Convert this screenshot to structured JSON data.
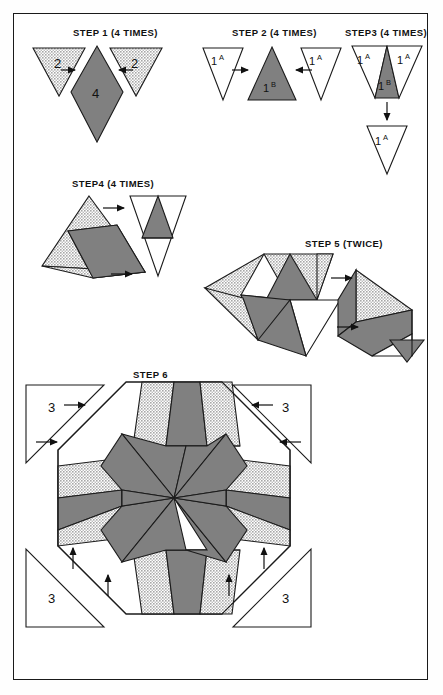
{
  "page": {
    "frame_color": "#1a1a1a",
    "background": "#ffffff"
  },
  "colors": {
    "dark_gray": "#808080",
    "light_gray_stipple": "#c9c9c9",
    "white": "#ffffff",
    "outline": "#1b1b1b",
    "text": "#111111"
  },
  "steps": [
    {
      "id": "step1",
      "label": "STEP 1 (4 TIMES)",
      "pieces": [
        {
          "name": "left-triangle-2",
          "value": "2",
          "fill": "light"
        },
        {
          "name": "center-diamond-4",
          "value": "4",
          "fill": "dark"
        },
        {
          "name": "right-triangle-2",
          "value": "2",
          "fill": "light"
        }
      ],
      "arrows": 2
    },
    {
      "id": "step2",
      "label": "STEP 2 (4 TIMES)",
      "pieces": [
        {
          "name": "left-triangle-1a",
          "value": "1",
          "sup": "A",
          "fill": "white"
        },
        {
          "name": "center-triangle-1b",
          "value": "1",
          "sup": "B",
          "fill": "dark"
        },
        {
          "name": "right-triangle-1a",
          "value": "1",
          "sup": "A",
          "fill": "white"
        }
      ],
      "arrows": 2
    },
    {
      "id": "step3",
      "label": "STEP3 (4 TIMES)",
      "pieces": [
        {
          "name": "left-triangle-1a",
          "value": "1",
          "sup": "A",
          "fill": "white"
        },
        {
          "name": "center-triangle-1b",
          "value": "1",
          "sup": "B",
          "fill": "dark"
        },
        {
          "name": "right-triangle-1a",
          "value": "1",
          "sup": "A",
          "fill": "white"
        },
        {
          "name": "bottom-triangle-1a",
          "value": "1",
          "sup": "A",
          "fill": "white"
        }
      ],
      "arrows": 1
    },
    {
      "id": "step4",
      "label": "STEP4 (4 TIMES)",
      "pieces": [
        {
          "name": "left-assembly",
          "fill": "mixed"
        },
        {
          "name": "right-inverted-unit",
          "fill": "mixed"
        }
      ],
      "arrows": 2
    },
    {
      "id": "step5",
      "label": "STEP 5 (TWICE)",
      "pieces": [
        {
          "name": "left-half-assembly",
          "fill": "mixed"
        },
        {
          "name": "right-half-assembly",
          "fill": "mixed"
        }
      ],
      "arrows": 2
    },
    {
      "id": "step6",
      "label": "STEP 6",
      "pieces": [
        {
          "name": "corner-triangle-top-left",
          "value": "3",
          "fill": "white"
        },
        {
          "name": "corner-triangle-top-right",
          "value": "3",
          "fill": "white"
        },
        {
          "name": "corner-triangle-bottom-left",
          "value": "3",
          "fill": "white"
        },
        {
          "name": "corner-triangle-bottom-right",
          "value": "3",
          "fill": "white"
        },
        {
          "name": "center-octagon-star",
          "fill": "mixed"
        }
      ],
      "arrows": 8
    }
  ]
}
